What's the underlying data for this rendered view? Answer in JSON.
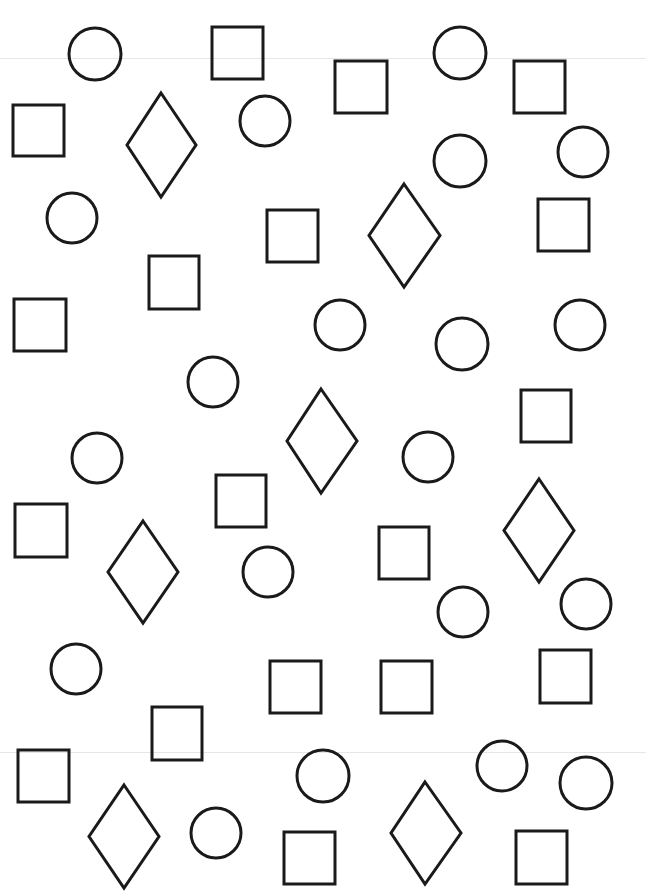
{
  "worksheet": {
    "stroke_color": "#1a1a1a",
    "background": "#ffffff",
    "stroke_width": 3,
    "shapes": [
      {
        "type": "circle",
        "cx": 95,
        "cy": 54,
        "r": 26
      },
      {
        "type": "square",
        "x": 212,
        "y": 27,
        "w": 51,
        "h": 52
      },
      {
        "type": "circle",
        "cx": 460,
        "cy": 53,
        "r": 26
      },
      {
        "type": "square",
        "x": 335,
        "y": 61,
        "w": 52,
        "h": 52
      },
      {
        "type": "square",
        "x": 514,
        "y": 61,
        "w": 51,
        "h": 52
      },
      {
        "type": "square",
        "x": 13,
        "y": 105,
        "w": 51,
        "h": 51
      },
      {
        "type": "diamond",
        "cx": 161,
        "top": 93,
        "bottom": 197,
        "left": 127,
        "right": 196
      },
      {
        "type": "circle",
        "cx": 265,
        "cy": 121,
        "r": 25
      },
      {
        "type": "circle",
        "cx": 460,
        "cy": 161,
        "r": 26
      },
      {
        "type": "circle",
        "cx": 583,
        "cy": 152,
        "r": 25
      },
      {
        "type": "circle",
        "cx": 72,
        "cy": 218,
        "r": 25
      },
      {
        "type": "square",
        "x": 267,
        "y": 210,
        "w": 51,
        "h": 52
      },
      {
        "type": "diamond",
        "cx": 404,
        "top": 184,
        "bottom": 287,
        "left": 369,
        "right": 440
      },
      {
        "type": "square",
        "x": 538,
        "y": 199,
        "w": 51,
        "h": 52
      },
      {
        "type": "square",
        "x": 149,
        "y": 256,
        "w": 50,
        "h": 53
      },
      {
        "type": "square",
        "x": 14,
        "y": 299,
        "w": 52,
        "h": 52
      },
      {
        "type": "circle",
        "cx": 340,
        "cy": 325,
        "r": 25
      },
      {
        "type": "circle",
        "cx": 462,
        "cy": 344,
        "r": 26
      },
      {
        "type": "circle",
        "cx": 580,
        "cy": 325,
        "r": 25
      },
      {
        "type": "circle",
        "cx": 213,
        "cy": 382,
        "r": 25
      },
      {
        "type": "diamond",
        "cx": 321,
        "top": 389,
        "bottom": 493,
        "left": 287,
        "right": 357
      },
      {
        "type": "square",
        "x": 521,
        "y": 390,
        "w": 50,
        "h": 52
      },
      {
        "type": "circle",
        "cx": 97,
        "cy": 458,
        "r": 25
      },
      {
        "type": "circle",
        "cx": 428,
        "cy": 457,
        "r": 25
      },
      {
        "type": "square",
        "x": 216,
        "y": 475,
        "w": 50,
        "h": 52
      },
      {
        "type": "diamond",
        "cx": 539,
        "top": 479,
        "bottom": 582,
        "left": 504,
        "right": 574
      },
      {
        "type": "square",
        "x": 15,
        "y": 504,
        "w": 52,
        "h": 53
      },
      {
        "type": "diamond",
        "cx": 143,
        "top": 521,
        "bottom": 623,
        "left": 108,
        "right": 178
      },
      {
        "type": "square",
        "x": 379,
        "y": 527,
        "w": 50,
        "h": 52
      },
      {
        "type": "circle",
        "cx": 268,
        "cy": 572,
        "r": 25
      },
      {
        "type": "circle",
        "cx": 463,
        "cy": 612,
        "r": 25
      },
      {
        "type": "circle",
        "cx": 586,
        "cy": 604,
        "r": 25
      },
      {
        "type": "circle",
        "cx": 76,
        "cy": 669,
        "r": 25
      },
      {
        "type": "square",
        "x": 270,
        "y": 661,
        "w": 51,
        "h": 52
      },
      {
        "type": "square",
        "x": 381,
        "y": 661,
        "w": 51,
        "h": 52
      },
      {
        "type": "square",
        "x": 540,
        "y": 650,
        "w": 51,
        "h": 53
      },
      {
        "type": "square",
        "x": 152,
        "y": 707,
        "w": 50,
        "h": 53
      },
      {
        "type": "square",
        "x": 18,
        "y": 750,
        "w": 51,
        "h": 52
      },
      {
        "type": "circle",
        "cx": 323,
        "cy": 776,
        "r": 26
      },
      {
        "type": "circle",
        "cx": 502,
        "cy": 766,
        "r": 25
      },
      {
        "type": "circle",
        "cx": 586,
        "cy": 783,
        "r": 26
      },
      {
        "type": "diamond",
        "cx": 124,
        "top": 785,
        "bottom": 888,
        "left": 89,
        "right": 159
      },
      {
        "type": "circle",
        "cx": 216,
        "cy": 833,
        "r": 25
      },
      {
        "type": "square",
        "x": 284,
        "y": 832,
        "w": 51,
        "h": 52
      },
      {
        "type": "diamond",
        "cx": 425,
        "top": 782,
        "bottom": 884,
        "left": 391,
        "right": 461
      },
      {
        "type": "square",
        "x": 516,
        "y": 831,
        "w": 51,
        "h": 53
      }
    ],
    "counts": {
      "circle": 20,
      "square": 20,
      "diamond": 6
    }
  }
}
